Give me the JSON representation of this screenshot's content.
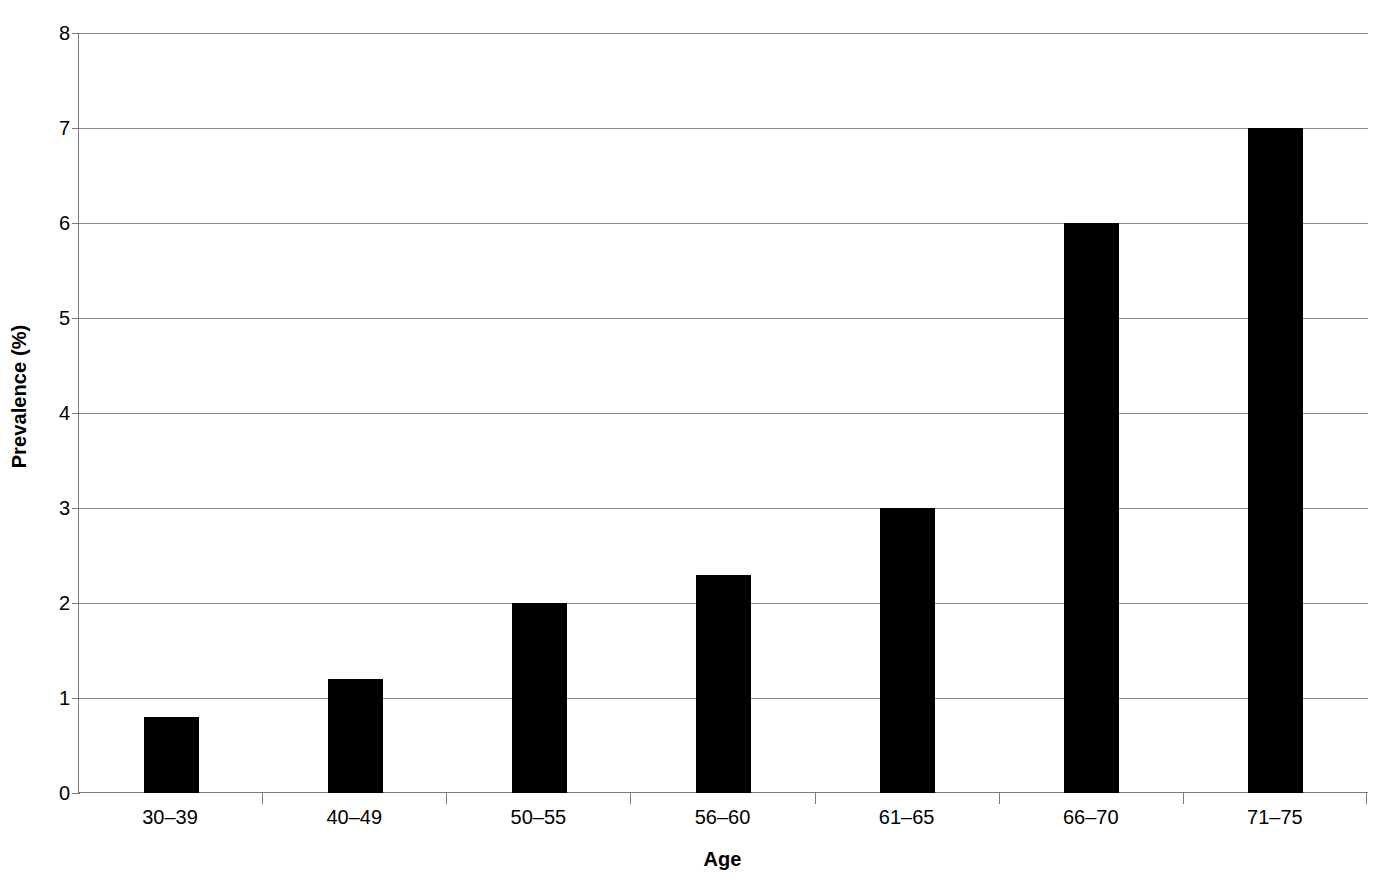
{
  "chart_data": {
    "type": "bar",
    "title": "",
    "xlabel": "Age",
    "ylabel": "Prevalence (%)",
    "categories": [
      "30–39",
      "40–49",
      "50–55",
      "56–60",
      "61–65",
      "66–70",
      "71–75"
    ],
    "values": [
      0.8,
      1.2,
      2.0,
      2.3,
      3.0,
      6.0,
      7.0
    ],
    "ylim": [
      0,
      8
    ],
    "ytick_labels": [
      "0",
      "1",
      "2",
      "3",
      "4",
      "5",
      "6",
      "7",
      "8"
    ],
    "ytick_values": [
      0,
      1,
      2,
      3,
      4,
      5,
      6,
      7,
      8
    ],
    "grid": true,
    "legend": false,
    "bar_color": "#000000",
    "gridline_color": "#8a8a8a",
    "axis_color": "#7a7a7a",
    "background_color": "#ffffff"
  }
}
